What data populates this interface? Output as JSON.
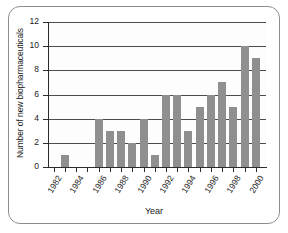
{
  "chart_data": {
    "type": "bar",
    "title": "",
    "xlabel": "Year",
    "ylabel": "Number of new biopharmaceuticals",
    "categories": [
      1982,
      1983,
      1984,
      1985,
      1986,
      1987,
      1988,
      1989,
      1990,
      1991,
      1992,
      1993,
      1994,
      1995,
      1996,
      1997,
      1998,
      1999,
      2000
    ],
    "values": [
      0,
      1,
      0,
      0,
      4,
      3,
      3,
      2,
      4,
      1,
      6,
      6,
      3,
      5,
      6,
      7,
      5,
      10,
      9
    ],
    "xlim": [
      1981.5,
      2000.9
    ],
    "ylim": [
      0,
      12
    ],
    "ytick_labels": [
      "0",
      "2",
      "4",
      "6",
      "8",
      "10",
      "12"
    ],
    "ytick_values": [
      0,
      2,
      4,
      6,
      8,
      10,
      12
    ],
    "xtick_values": [
      1982,
      1983,
      1984,
      1985,
      1986,
      1987,
      1988,
      1989,
      1990,
      1991,
      1992,
      1993,
      1994,
      1995,
      1996,
      1997,
      1998,
      1999,
      2000
    ],
    "xtick_labels_shown": [
      "1982",
      "1984",
      "1986",
      "1988",
      "1990",
      "1992",
      "1994",
      "1996",
      "1998",
      "2000"
    ],
    "xtick_label_years": [
      1982,
      1984,
      1986,
      1988,
      1990,
      1992,
      1994,
      1996,
      1998,
      2000
    ],
    "grid": "horizontal",
    "legend": "none",
    "bar_color": "#8f8f8f",
    "axis_color": "#2b2b2b",
    "grid_color": "#4d4d4d",
    "background_color": "#ffffff"
  }
}
